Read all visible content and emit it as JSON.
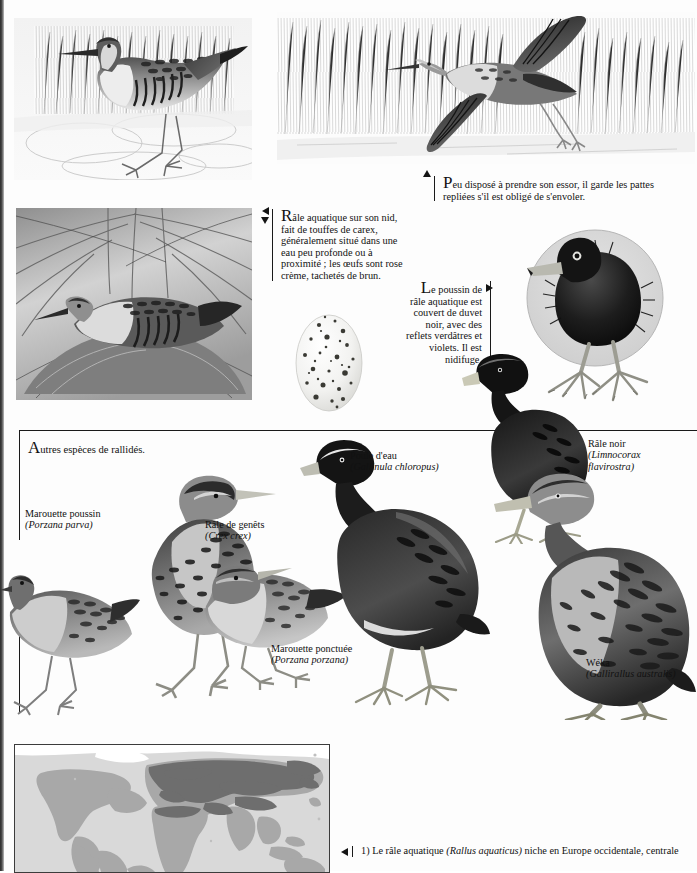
{
  "page": {
    "background_hex": "#fdfdfd",
    "ink_hex": "#111111",
    "map_land_hex": "#a8a8a8",
    "map_range_hex": "#6e6e6e",
    "map_sea_hex": "#d9d9d9"
  },
  "captions": {
    "flight": {
      "text": "Peu disposé à prendre son essor, il garde les pattes repliées s'il est obligé de s'envoler.",
      "marker": "triangle-up"
    },
    "nest": {
      "text": "Râle aquatique sur son nid, fait de touffes de carex, généralement situé dans une eau peu profonde ou à proximité ; les œufs sont rose crème, tachetés de brun.",
      "marker": "triangle-left-and-down"
    },
    "chick": {
      "text": "Le poussin de râle aquatique est couvert de duvet noir, avec des reflets verdâtres et violets. Il est nidifuge.",
      "marker": "triangle-right"
    }
  },
  "plate": {
    "title": "Autres espèces de rallidés.",
    "species": [
      {
        "common": "Marouette poussin",
        "latin": "(Porzana parva)"
      },
      {
        "common": "Râle de genêts",
        "latin": "(Crex crex)"
      },
      {
        "common": "Poule d'eau",
        "latin": "(Gallinula chloropus)"
      },
      {
        "common": "Râle noir",
        "latin": "(Limnocorax flavirostra)"
      },
      {
        "common": "Marouette ponctuée",
        "latin": "(Porzana porzana)"
      },
      {
        "common": "Wéka",
        "latin": "(Gallirallus australis)"
      }
    ]
  },
  "footnote": {
    "number": "1)",
    "text_before": "Le râle aquatique",
    "latin": "(Rallus aquaticus)",
    "text_after": "niche en Europe occidentale, centrale",
    "marker": "triangle-left"
  }
}
